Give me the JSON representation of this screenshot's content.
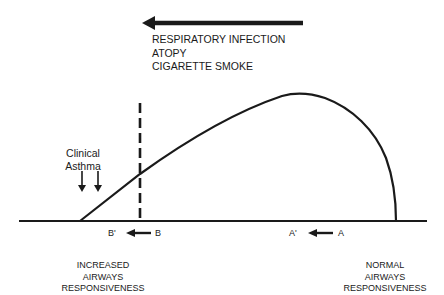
{
  "diagram": {
    "top_arrow_direction": "left",
    "factors": [
      "RESPIRATORY INFECTION",
      "ATOPY",
      "CIGARETTE SMOKE"
    ],
    "clinical_label": [
      "Clinical",
      "Asthma"
    ],
    "markers": {
      "b_prime": "B'",
      "b": "B",
      "a_prime": "A'",
      "a": "A"
    },
    "increased_label": [
      "INCREASED",
      "AIRWAYS",
      "RESPONSIVENESS"
    ],
    "normal_label": [
      "NORMAL",
      "AIRWAYS",
      "RESPONSIVENESS"
    ],
    "colors": {
      "ink": "#1a1a1a",
      "background": "#ffffff"
    }
  }
}
